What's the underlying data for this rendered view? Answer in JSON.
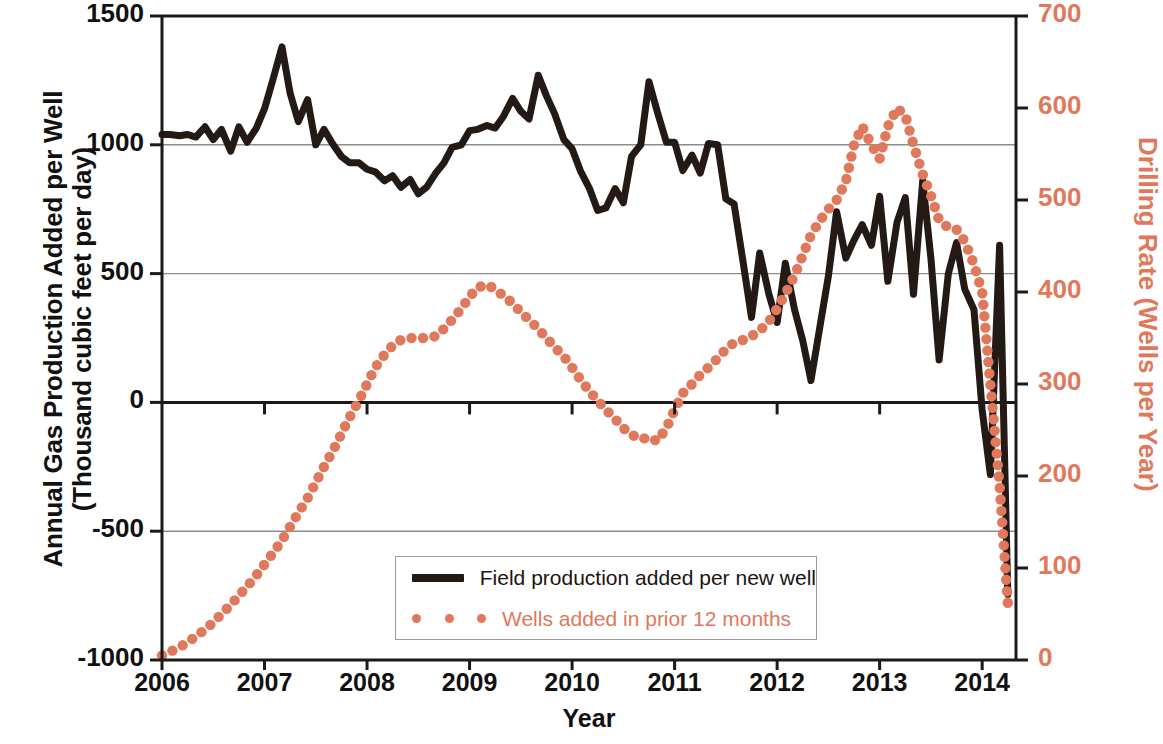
{
  "chart_data": {
    "type": "line",
    "title": "",
    "xlabel": "Year",
    "ylabel_left": "Annual Gas Production Added per Well\n(Thousand cubic feet per day)",
    "ylabel_left_line1": "Annual Gas Production Added per Well",
    "ylabel_left_line2": "(Thousand cubic feet per day)",
    "ylabel_right": "Drilling Rate (Wells per Year)",
    "xlim": [
      2006,
      2014.33
    ],
    "ylim_left": [
      -1000,
      1500
    ],
    "ylim_right": [
      0,
      700
    ],
    "xticks": [
      "2006",
      "2007",
      "2008",
      "2009",
      "2010",
      "2011",
      "2012",
      "2013",
      "2014"
    ],
    "yticks_left": [
      "1500",
      "1000",
      "500",
      "0",
      "-500",
      "-1000"
    ],
    "yticks_right": [
      "700",
      "600",
      "500",
      "400",
      "300",
      "200",
      "100",
      "0"
    ],
    "grid": "horizontal",
    "legend_position": "bottom-center",
    "colors": {
      "series1": "#231a15",
      "series2": "#E0785C",
      "axis": "#1a1a1a",
      "grid": "#8c8c8c"
    },
    "series": [
      {
        "name": "Field production added per new well",
        "axis": "left",
        "style": "solid-line",
        "color": "#231a15",
        "x": [
          2006.0,
          2006.08,
          2006.17,
          2006.25,
          2006.33,
          2006.42,
          2006.5,
          2006.58,
          2006.67,
          2006.75,
          2006.83,
          2006.92,
          2007.0,
          2007.08,
          2007.17,
          2007.25,
          2007.33,
          2007.42,
          2007.5,
          2007.58,
          2007.67,
          2007.75,
          2007.83,
          2007.92,
          2008.0,
          2008.08,
          2008.17,
          2008.25,
          2008.33,
          2008.42,
          2008.5,
          2008.58,
          2008.67,
          2008.75,
          2008.83,
          2008.92,
          2009.0,
          2009.08,
          2009.17,
          2009.25,
          2009.33,
          2009.42,
          2009.5,
          2009.58,
          2009.67,
          2009.75,
          2009.83,
          2009.92,
          2010.0,
          2010.08,
          2010.17,
          2010.25,
          2010.33,
          2010.42,
          2010.5,
          2010.58,
          2010.67,
          2010.75,
          2010.83,
          2010.92,
          2011.0,
          2011.08,
          2011.17,
          2011.25,
          2011.33,
          2011.42,
          2011.5,
          2011.58,
          2011.67,
          2011.75,
          2011.83,
          2011.92,
          2012.0,
          2012.08,
          2012.17,
          2012.25,
          2012.33,
          2012.42,
          2012.5,
          2012.58,
          2012.67,
          2012.75,
          2012.83,
          2012.92,
          2013.0,
          2013.08,
          2013.17,
          2013.25,
          2013.33,
          2013.42,
          2013.5,
          2013.58,
          2013.67,
          2013.75,
          2013.83,
          2013.92,
          2014.0,
          2014.08,
          2014.17,
          2014.25
        ],
        "values": [
          1040,
          1040,
          1035,
          1040,
          1030,
          1070,
          1020,
          1060,
          975,
          1070,
          1010,
          1065,
          1140,
          1250,
          1380,
          1200,
          1090,
          1175,
          1000,
          1060,
          1000,
          955,
          930,
          930,
          905,
          895,
          860,
          880,
          835,
          865,
          810,
          835,
          890,
          930,
          990,
          1000,
          1055,
          1060,
          1075,
          1065,
          1110,
          1180,
          1130,
          1100,
          1270,
          1190,
          1120,
          1020,
          985,
          900,
          830,
          745,
          755,
          830,
          775,
          955,
          1000,
          1245,
          1130,
          1010,
          1010,
          900,
          960,
          890,
          1005,
          1000,
          790,
          770,
          540,
          330,
          580,
          420,
          310,
          540,
          360,
          240,
          85,
          300,
          490,
          740,
          560,
          630,
          690,
          610,
          800,
          470,
          700,
          795,
          420,
          860,
          560,
          165,
          500,
          620,
          440,
          360,
          -30,
          -280,
          610,
          -745
        ]
      },
      {
        "name": "Wells added in prior 12 months",
        "axis": "right",
        "style": "dotted",
        "color": "#E0785C",
        "x": [
          2006.0,
          2006.08,
          2006.17,
          2006.25,
          2006.33,
          2006.42,
          2006.5,
          2006.58,
          2006.67,
          2006.75,
          2006.83,
          2006.92,
          2007.0,
          2007.08,
          2007.17,
          2007.25,
          2007.33,
          2007.42,
          2007.5,
          2007.58,
          2007.67,
          2007.75,
          2007.83,
          2007.92,
          2008.0,
          2008.08,
          2008.17,
          2008.25,
          2008.33,
          2008.42,
          2008.5,
          2008.58,
          2008.67,
          2008.75,
          2008.83,
          2008.92,
          2009.0,
          2009.08,
          2009.17,
          2009.25,
          2009.33,
          2009.42,
          2009.5,
          2009.58,
          2009.67,
          2009.75,
          2009.83,
          2009.92,
          2010.0,
          2010.08,
          2010.17,
          2010.25,
          2010.33,
          2010.42,
          2010.5,
          2010.58,
          2010.67,
          2010.75,
          2010.83,
          2010.92,
          2011.0,
          2011.08,
          2011.17,
          2011.25,
          2011.33,
          2011.42,
          2011.5,
          2011.58,
          2011.67,
          2011.75,
          2011.83,
          2011.92,
          2012.0,
          2012.08,
          2012.17,
          2012.25,
          2012.33,
          2012.42,
          2012.5,
          2012.58,
          2012.67,
          2012.75,
          2012.83,
          2012.92,
          2013.0,
          2013.08,
          2013.17,
          2013.25,
          2013.33,
          2013.42,
          2013.5,
          2013.58,
          2013.67,
          2013.75,
          2013.83,
          2013.92,
          2014.0,
          2014.08,
          2014.17,
          2014.25
        ],
        "values": [
          5,
          9,
          14,
          19,
          26,
          33,
          41,
          50,
          60,
          70,
          80,
          92,
          104,
          116,
          130,
          145,
          160,
          176,
          193,
          210,
          228,
          246,
          264,
          282,
          300,
          318,
          332,
          342,
          348,
          350,
          350,
          350,
          352,
          360,
          370,
          382,
          395,
          405,
          408,
          403,
          396,
          388,
          378,
          370,
          360,
          350,
          340,
          330,
          318,
          305,
          292,
          282,
          272,
          262,
          252,
          245,
          240,
          242,
          238,
          252,
          272,
          290,
          300,
          310,
          318,
          328,
          338,
          345,
          348,
          352,
          358,
          368,
          382,
          398,
          418,
          440,
          462,
          478,
          490,
          500,
          520,
          560,
          580,
          560,
          545,
          580,
          600,
          592,
          560,
          528,
          505,
          478,
          470,
          468,
          455,
          430,
          400,
          300,
          190,
          62
        ]
      }
    ]
  },
  "legend": {
    "items": [
      {
        "label": "Field production added per new well",
        "marker": "solid-line",
        "color": "#231a15"
      },
      {
        "label": "Wells added in prior 12 months",
        "marker": "dotted",
        "color": "#E0785C"
      }
    ]
  }
}
